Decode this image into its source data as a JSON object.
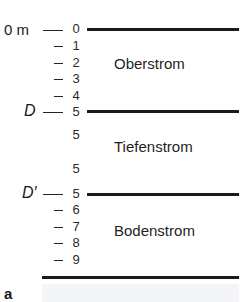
{
  "figure": {
    "panel_label": "a",
    "surface_label": "0 m",
    "interface_labels": {
      "upper": "D",
      "lower": "D′"
    },
    "layers": [
      {
        "name": "Oberstrom",
        "top_label": "0",
        "levels": [
          "0",
          "1",
          "2",
          "3",
          "4",
          "5"
        ]
      },
      {
        "name": "Tiefenstrom",
        "levels": [
          "5",
          "5"
        ]
      },
      {
        "name": "Bodenstrom",
        "levels": [
          "5",
          "6",
          "7",
          "8",
          "9"
        ]
      }
    ],
    "tick_numbers": {
      "n0": "0",
      "n1": "1",
      "n2": "2",
      "n3": "3",
      "n4": "4",
      "n5a": "5",
      "n5b": "5",
      "n5c": "5",
      "n5d": "5",
      "n6": "6",
      "n7": "7",
      "n8": "8",
      "n9": "9"
    }
  }
}
